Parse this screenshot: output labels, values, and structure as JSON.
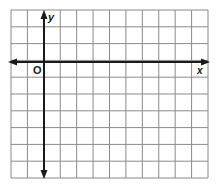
{
  "diagram": {
    "type": "coordinate-grid",
    "columns": 12,
    "rows": 10,
    "y_axis_column": 2,
    "x_axis_row": 3,
    "labels": {
      "x_axis": "x",
      "y_axis": "y",
      "origin": "O"
    },
    "colors": {
      "grid": "#8a8a8a",
      "axis": "#1a1a1a",
      "background": "#ffffff"
    }
  }
}
